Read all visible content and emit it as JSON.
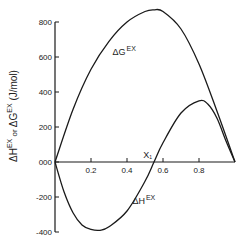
{
  "chart_data": {
    "type": "line",
    "title": "",
    "xlabel": "X1",
    "ylabel": "ΔH̄EX or ΔḠEX (J/mol)",
    "x_tick_labels": [
      "0.2",
      "0.4",
      "0.6",
      "0.8"
    ],
    "y_tick_labels": [
      "800",
      "600",
      "400",
      "200",
      "000",
      "-200",
      "-400"
    ],
    "y_ticks": [
      800,
      600,
      400,
      200,
      0,
      -200,
      -400
    ],
    "x_ticks": [
      0.2,
      0.4,
      0.6,
      0.8
    ],
    "xlim": [
      0,
      1.0
    ],
    "ylim": [
      -400,
      800
    ],
    "grid": false,
    "legend": "none (inline curve labels)",
    "series": [
      {
        "name": "ΔḠEX",
        "label": "ΔG",
        "label_sup": "EX",
        "x": [
          0,
          0.1,
          0.2,
          0.3,
          0.4,
          0.5,
          0.55,
          0.6,
          0.7,
          0.8,
          0.9,
          1.0
        ],
        "values": [
          0,
          300,
          530,
          690,
          800,
          860,
          870,
          860,
          760,
          560,
          290,
          0
        ]
      },
      {
        "name": "ΔH̄EX",
        "label": "ΔH",
        "label_sup": "EX",
        "x": [
          0,
          0.05,
          0.1,
          0.15,
          0.2,
          0.25,
          0.3,
          0.4,
          0.5,
          0.55,
          0.6,
          0.7,
          0.8,
          0.85,
          0.9,
          0.95,
          1.0
        ],
        "values": [
          0,
          -170,
          -290,
          -360,
          -385,
          -390,
          -370,
          -280,
          -110,
          0,
          110,
          280,
          350,
          330,
          250,
          120,
          0
        ]
      }
    ],
    "annotations": [
      {
        "text": "ΔG",
        "sup": "EX",
        "x": 0.32,
        "y": 610
      },
      {
        "text": "ΔH",
        "sup": "EX",
        "x": 0.43,
        "y": -240
      },
      {
        "text": "X",
        "sub": "1",
        "x": 0.49,
        "y": 40
      }
    ]
  },
  "axis": {
    "y_label_main": "ΔH",
    "y_label_sup1": "EX",
    "y_label_or": " or ",
    "y_label_g": "ΔG",
    "y_label_sup2": "EX",
    "y_label_unit": " (J/mol)",
    "x_label": "X",
    "x_label_sub": "1"
  },
  "colors": {
    "line": "#1a1a1a",
    "axis": "#1a1a1a",
    "background": "#ffffff"
  }
}
